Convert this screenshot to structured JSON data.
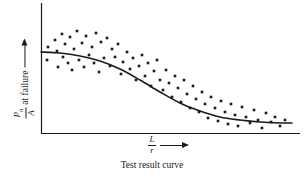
{
  "figure": {
    "caption": "Test result curve",
    "background_color": "#ffffff",
    "ink_color": "#1a1a1a"
  },
  "axes": {
    "y_axis": {
      "label_numerator": "P",
      "label_numerator_sub": "n",
      "label_denominator": "A",
      "label_suffix": "at failure",
      "arrow_direction": "up",
      "line": {
        "x": 41,
        "y_top": 3,
        "y_bottom": 133
      }
    },
    "x_axis": {
      "label_numerator": "L",
      "label_denominator": "r",
      "arrow_direction": "right",
      "line": {
        "y": 133,
        "x_left": 41,
        "x_right": 300
      }
    }
  },
  "chart_data": {
    "type": "scatter",
    "title": "Test result curve",
    "xlabel": "L/r",
    "ylabel": "Pn/A at failure",
    "grid": false,
    "legend": "none",
    "xlim": [
      41,
      300
    ],
    "ylim": [
      133,
      3
    ],
    "axis_units": "pixels (unlabeled qualitative axes)",
    "note": "Qualitative schematic: axes carry no numeric tick labels; values are read as screen coordinates of the plotted marks.",
    "series": [
      {
        "name": "test results",
        "marker": "square",
        "marker_size": 2.6,
        "color": "#1a1a1a",
        "points": [
          [
            47,
            60
          ],
          [
            48,
            47
          ],
          [
            55,
            40
          ],
          [
            57,
            51
          ],
          [
            58,
            67
          ],
          [
            62,
            34
          ],
          [
            63,
            57
          ],
          [
            65,
            44
          ],
          [
            68,
            63
          ],
          [
            70,
            37
          ],
          [
            72,
            70
          ],
          [
            74,
            49
          ],
          [
            77,
            31
          ],
          [
            79,
            60
          ],
          [
            82,
            43
          ],
          [
            84,
            67
          ],
          [
            86,
            36
          ],
          [
            89,
            55
          ],
          [
            92,
            47
          ],
          [
            94,
            63
          ],
          [
            96,
            33
          ],
          [
            99,
            72
          ],
          [
            101,
            42
          ],
          [
            104,
            58
          ],
          [
            107,
            38
          ],
          [
            110,
            66
          ],
          [
            112,
            49
          ],
          [
            115,
            57
          ],
          [
            118,
            44
          ],
          [
            121,
            74
          ],
          [
            123,
            62
          ],
          [
            127,
            52
          ],
          [
            130,
            69
          ],
          [
            133,
            58
          ],
          [
            136,
            80
          ],
          [
            139,
            66
          ],
          [
            142,
            55
          ],
          [
            145,
            76
          ],
          [
            148,
            63
          ],
          [
            151,
            86
          ],
          [
            154,
            71
          ],
          [
            157,
            60
          ],
          [
            160,
            80
          ],
          [
            163,
            90
          ],
          [
            166,
            70
          ],
          [
            169,
            83
          ],
          [
            172,
            97
          ],
          [
            175,
            76
          ],
          [
            178,
            88
          ],
          [
            181,
            102
          ],
          [
            184,
            80
          ],
          [
            187,
            94
          ],
          [
            190,
            108
          ],
          [
            193,
            86
          ],
          [
            196,
            99
          ],
          [
            199,
            112
          ],
          [
            202,
            92
          ],
          [
            205,
            104
          ],
          [
            208,
            118
          ],
          [
            211,
            97
          ],
          [
            215,
            108
          ],
          [
            218,
            121
          ],
          [
            221,
            101
          ],
          [
            225,
            112
          ],
          [
            228,
            124
          ],
          [
            231,
            104
          ],
          [
            235,
            115
          ],
          [
            238,
            126
          ],
          [
            242,
            107
          ],
          [
            246,
            117
          ],
          [
            250,
            123
          ],
          [
            254,
            110
          ],
          [
            258,
            120
          ],
          [
            262,
            128
          ],
          [
            266,
            113
          ],
          [
            271,
            122
          ],
          [
            275,
            117
          ],
          [
            280,
            126
          ],
          [
            285,
            120
          ]
        ]
      }
    ],
    "fit_curve": {
      "name": "fitted test result curve",
      "shape": "sigmoid (reverse S)",
      "color": "#1a1a1a",
      "line_width": 1.6,
      "path_points": [
        [
          41,
          52
        ],
        [
          60,
          53
        ],
        [
          80,
          56
        ],
        [
          100,
          61
        ],
        [
          120,
          69
        ],
        [
          140,
          80
        ],
        [
          160,
          92
        ],
        [
          180,
          103
        ],
        [
          200,
          111
        ],
        [
          220,
          117
        ],
        [
          240,
          120
        ],
        [
          260,
          122
        ],
        [
          280,
          123
        ],
        [
          292,
          123
        ]
      ]
    }
  }
}
